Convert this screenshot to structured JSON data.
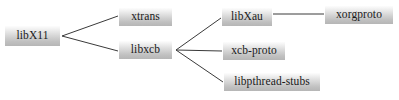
{
  "diagram": {
    "type": "dependency-tree",
    "background_color": "#ffffff",
    "node_fill_top": "#fdfdfd",
    "node_fill_bottom": "#b6b6b6",
    "edge_color": "#3a3a3a",
    "text_color": "#1a1a1a",
    "nodes": [
      {
        "id": "libx11",
        "label": "libX11",
        "x": 5,
        "y": 26,
        "w": 55,
        "h": 20
      },
      {
        "id": "xtrans",
        "label": "xtrans",
        "x": 119,
        "y": 8,
        "w": 53,
        "h": 18
      },
      {
        "id": "libxcb",
        "label": "libxcb",
        "x": 119,
        "y": 41,
        "w": 53,
        "h": 18
      },
      {
        "id": "libxau",
        "label": "libXau",
        "x": 222,
        "y": 8,
        "w": 50,
        "h": 18
      },
      {
        "id": "xcb-proto",
        "label": "xcb-proto",
        "x": 223,
        "y": 42,
        "w": 62,
        "h": 18
      },
      {
        "id": "libpthread-stubs",
        "label": "libpthread-stubs",
        "x": 224,
        "y": 73,
        "w": 96,
        "h": 18
      },
      {
        "id": "xorgproto",
        "label": "xorgproto",
        "x": 325,
        "y": 6,
        "w": 68,
        "h": 18
      }
    ],
    "edges": [
      {
        "id": "libx11-xtrans",
        "from": "libX11",
        "to": "xtrans",
        "x1": 62,
        "y1": 36,
        "x2": 118,
        "y2": 16
      },
      {
        "id": "libx11-libxcb",
        "from": "libX11",
        "to": "libxcb",
        "x1": 62,
        "y1": 36,
        "x2": 118,
        "y2": 51
      },
      {
        "id": "libxcb-libxau",
        "from": "libxcb",
        "to": "libXau",
        "x1": 176,
        "y1": 50,
        "x2": 221,
        "y2": 18
      },
      {
        "id": "libxcb-xcb-proto",
        "from": "libxcb",
        "to": "xcb-proto",
        "x1": 176,
        "y1": 50,
        "x2": 222,
        "y2": 51
      },
      {
        "id": "libxcb-libpthread-stubs",
        "from": "libxcb",
        "to": "libpthread-stubs",
        "x1": 176,
        "y1": 50,
        "x2": 223,
        "y2": 82
      },
      {
        "id": "libxau-xorgproto",
        "from": "libXau",
        "to": "xorgproto",
        "x1": 273,
        "y1": 14,
        "x2": 324,
        "y2": 14
      }
    ]
  }
}
